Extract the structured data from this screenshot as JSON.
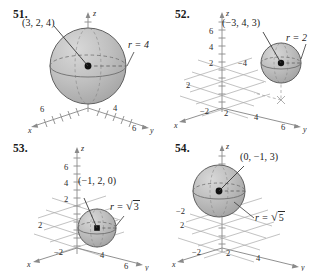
{
  "page": {
    "background": "#ffffff",
    "ink": "#2b2b2b",
    "sphere_fill": "#b9b9b9",
    "sphere_fill_light": "#cfcfcf",
    "sphere_stroke": "#6e6e6e",
    "axis_color": "#8a8a8a",
    "point_color": "#111111"
  },
  "figures": [
    {
      "number": "51.",
      "center_label": "(3, 2, 4)",
      "radius_label": "r = 4",
      "axes": {
        "x": "x",
        "y": "y",
        "z": "z",
        "x_ticks": [
          "6"
        ],
        "y_ticks": [
          "4",
          "6"
        ],
        "z_ticks": [
          "6"
        ]
      }
    },
    {
      "number": "52.",
      "center_label": "(−3, 4, 3)",
      "radius_label": "r = 2",
      "axes": {
        "x": "x",
        "y": "y",
        "z": "z",
        "x_ticks": [
          "2",
          "−2"
        ],
        "y_ticks": [
          "2",
          "4",
          "6"
        ],
        "z_ticks": [
          "2",
          "4",
          "6"
        ],
        "extra_ticks": [
          "−4"
        ]
      }
    },
    {
      "number": "53.",
      "center_label": "(−1, 2, 0)",
      "radius_label": "r = √3",
      "radius_prefix": "r = ",
      "radius_root": "3",
      "axes": {
        "x": "x",
        "y": "y",
        "z": "z",
        "x_ticks": [
          "2",
          "−2"
        ],
        "y_ticks": [
          "4",
          "6"
        ],
        "z_ticks": [
          "2",
          "4",
          "6"
        ]
      }
    },
    {
      "number": "54.",
      "center_label": "(0, −1, 3)",
      "radius_label": "r = √5",
      "radius_prefix": "r = ",
      "radius_root": "5",
      "axes": {
        "x": "x",
        "y": "y",
        "z": "z",
        "x_ticks": [
          "2",
          "−2"
        ],
        "y_ticks": [
          "2",
          "4"
        ],
        "z_ticks": [
          "z"
        ],
        "extra_ticks": [
          "−2",
          "2"
        ]
      }
    }
  ]
}
